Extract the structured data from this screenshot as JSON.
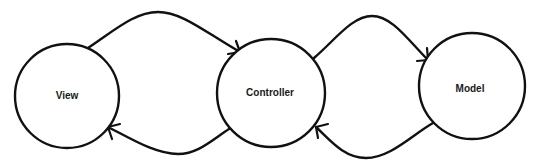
{
  "diagram": {
    "type": "mvc-flow",
    "stroke_color": "#111111",
    "background": "#ffffff",
    "nodes": [
      {
        "id": "view",
        "label": "View",
        "cx": 67,
        "cy": 96,
        "r": 52
      },
      {
        "id": "controller",
        "label": "Controller",
        "cx": 271,
        "cy": 93,
        "r": 54
      },
      {
        "id": "model",
        "label": "Model",
        "cx": 472,
        "cy": 86,
        "r": 53
      }
    ],
    "edges": [
      {
        "id": "view-to-controller",
        "from": "view",
        "to": "controller",
        "position": "top"
      },
      {
        "id": "controller-to-view",
        "from": "controller",
        "to": "view",
        "position": "bottom"
      },
      {
        "id": "controller-to-model",
        "from": "controller",
        "to": "model",
        "position": "top"
      },
      {
        "id": "model-to-controller",
        "from": "model",
        "to": "controller",
        "position": "bottom"
      }
    ]
  }
}
